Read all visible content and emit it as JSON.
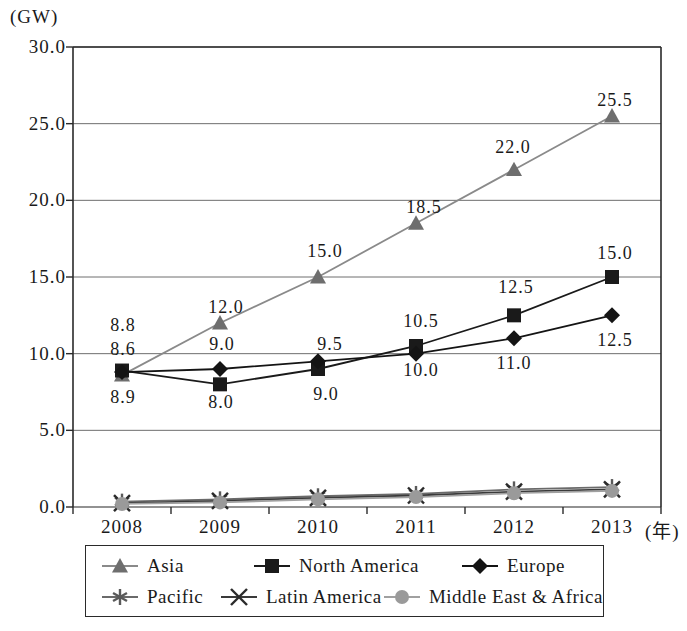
{
  "chart_data": {
    "type": "line",
    "title": "",
    "xlabel": "(年)",
    "ylabel": "(GW)",
    "x": [
      "2008",
      "2009",
      "2010",
      "2011",
      "2012",
      "2013"
    ],
    "ylim": [
      0.0,
      30.0
    ],
    "yticks": [
      "0.0",
      "5.0",
      "10.0",
      "15.0",
      "20.0",
      "25.0",
      "30.0"
    ],
    "ytick_values": [
      0.0,
      5.0,
      10.0,
      15.0,
      20.0,
      25.0,
      30.0
    ],
    "grid": true,
    "legend_position": "bottom",
    "series": [
      {
        "name": "Asia",
        "marker": "triangle-icon",
        "color": "#6e6e6e",
        "line_color": "#8a8a8a",
        "values": [
          8.6,
          12.0,
          15.0,
          18.5,
          22.0,
          25.5
        ],
        "labels": [
          "8.6",
          "12.0",
          "15.0",
          "18.5",
          "22.0",
          "25.5"
        ]
      },
      {
        "name": "North America",
        "marker": "square-icon",
        "color": "#1a1a1a",
        "line_color": "#1a1a1a",
        "values": [
          8.9,
          8.0,
          9.0,
          10.5,
          12.5,
          15.0
        ],
        "labels": [
          "8.9",
          "8.0",
          "9.0",
          "10.5",
          "12.5",
          "15.0"
        ]
      },
      {
        "name": "Europe",
        "marker": "diamond-icon",
        "color": "#141414",
        "line_color": "#141414",
        "values": [
          8.8,
          9.0,
          9.5,
          10.0,
          11.0,
          12.5
        ],
        "labels": [
          "8.8",
          "9.0",
          "9.5",
          "10.0",
          "11.0",
          "12.5"
        ]
      },
      {
        "name": "Pacific",
        "marker": "asterisk-icon",
        "color": "#5a5a5a",
        "line_color": "#6a6a6a",
        "values": [
          0.35,
          0.5,
          0.7,
          0.85,
          1.15,
          1.3
        ],
        "labels": [
          "",
          "",
          "",
          "",
          "",
          ""
        ]
      },
      {
        "name": "Latin America",
        "marker": "cross-icon",
        "color": "#2a2a2a",
        "line_color": "#3a3a3a",
        "values": [
          0.25,
          0.4,
          0.6,
          0.75,
          1.0,
          1.15
        ],
        "labels": [
          "",
          "",
          "",
          "",
          "",
          ""
        ]
      },
      {
        "name": "Middle East & Africa",
        "marker": "circle-icon",
        "color": "#9a9a9a",
        "line_color": "#a0a0a0",
        "values": [
          0.2,
          0.3,
          0.5,
          0.65,
          0.9,
          1.05
        ],
        "labels": [
          "",
          "",
          "",
          "",
          "",
          ""
        ]
      }
    ],
    "annotations": [
      {
        "series": "Europe",
        "x": "2008",
        "text": "8.8",
        "px": 123,
        "py": 325
      },
      {
        "series": "Asia",
        "x": "2008",
        "text": "8.6",
        "px": 123,
        "py": 349
      },
      {
        "series": "North America",
        "x": "2008",
        "text": "8.9",
        "px": 123,
        "py": 397
      },
      {
        "series": "Asia",
        "x": "2009",
        "text": "12.0",
        "px": 226,
        "py": 307
      },
      {
        "series": "Europe",
        "x": "2009",
        "text": "9.0",
        "px": 222,
        "py": 344
      },
      {
        "series": "North America",
        "x": "2009",
        "text": "8.0",
        "px": 221,
        "py": 402
      },
      {
        "series": "Asia",
        "x": "2010",
        "text": "15.0",
        "px": 325,
        "py": 251
      },
      {
        "series": "Europe",
        "x": "2010",
        "text": "9.5",
        "px": 330,
        "py": 344
      },
      {
        "series": "North America",
        "x": "2010",
        "text": "9.0",
        "px": 326,
        "py": 394
      },
      {
        "series": "Asia",
        "x": "2011",
        "text": "18.5",
        "px": 424,
        "py": 207
      },
      {
        "series": "North America",
        "x": "2011",
        "text": "10.5",
        "px": 421,
        "py": 321
      },
      {
        "series": "Europe",
        "x": "2011",
        "text": "10.0",
        "px": 421,
        "py": 370
      },
      {
        "series": "Asia",
        "x": "2012",
        "text": "22.0",
        "px": 513,
        "py": 147
      },
      {
        "series": "North America",
        "x": "2012",
        "text": "12.5",
        "px": 516,
        "py": 287
      },
      {
        "series": "Europe",
        "x": "2012",
        "text": "11.0",
        "px": 514,
        "py": 363
      },
      {
        "series": "Asia",
        "x": "2013",
        "text": "25.5",
        "px": 615,
        "py": 100
      },
      {
        "series": "North America",
        "x": "2013",
        "text": "15.0",
        "px": 615,
        "py": 253
      },
      {
        "series": "Europe",
        "x": "2013",
        "text": "12.5",
        "px": 615,
        "py": 340
      }
    ]
  },
  "legend": {
    "rows": [
      [
        {
          "label": "Asia",
          "marker": "triangle-icon"
        },
        {
          "label": "North America",
          "marker": "square-icon"
        },
        {
          "label": "Europe",
          "marker": "diamond-icon"
        }
      ],
      [
        {
          "label": "Pacific",
          "marker": "asterisk-icon"
        },
        {
          "label": "Latin America",
          "marker": "cross-icon"
        },
        {
          "label": "Middle East & Africa",
          "marker": "circle-icon"
        }
      ]
    ]
  }
}
